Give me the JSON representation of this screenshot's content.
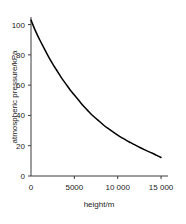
{
  "chart_data": {
    "type": "line",
    "title": "",
    "xlabel": "height/m",
    "ylabel": "atmospheric pressure/kPa",
    "xlim": [
      0,
      15800
    ],
    "ylim": [
      0,
      105
    ],
    "grid": false,
    "legend": null,
    "xticks": [
      0,
      5000,
      10000,
      15000
    ],
    "xticklabels": [
      "0",
      "5000",
      "10 000",
      "15 000"
    ],
    "yticks": [
      0,
      20,
      40,
      60,
      80,
      100
    ],
    "yticklabels": [
      "0",
      "20",
      "40",
      "60",
      "80",
      "100"
    ],
    "line_color": "#000000",
    "background_color": "#ffffff",
    "axis_color": "#3a3a3a",
    "series": [
      {
        "name": "atmospheric pressure",
        "x": [
          0,
          500,
          1000,
          1500,
          2000,
          2500,
          3000,
          3500,
          4000,
          4500,
          5000,
          5500,
          6000,
          6500,
          7000,
          7500,
          8000,
          8500,
          9000,
          9500,
          10000,
          10500,
          11000,
          11500,
          12000,
          12500,
          13000,
          13500,
          14000,
          14500,
          15000
        ],
        "y": [
          103,
          96,
          90,
          84.5,
          79,
          74,
          69.5,
          65,
          61,
          57,
          53.5,
          50,
          46.5,
          43.5,
          40.5,
          38,
          35.5,
          33,
          31,
          29,
          27,
          25.2,
          23.5,
          22,
          20.5,
          19,
          17.6,
          16.3,
          15,
          13.6,
          12.2
        ]
      }
    ]
  },
  "axes": {
    "x_title": "height/m",
    "y_title": "atmospheric pressure/kPa"
  }
}
